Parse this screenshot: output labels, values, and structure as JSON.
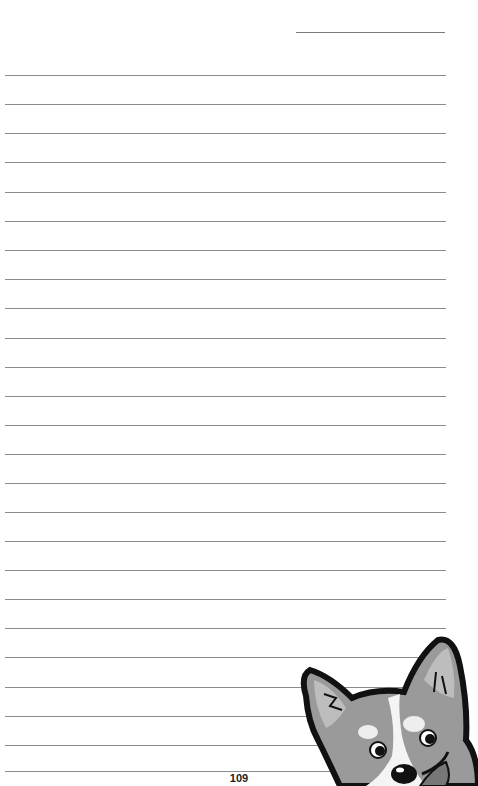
{
  "page": {
    "type": "lined-notebook-page",
    "page_number": "109",
    "line_count": 25,
    "top_line": {
      "label": "date-line"
    },
    "line_positions": [
      75,
      104,
      133,
      162,
      192,
      221,
      250,
      279,
      308,
      338,
      367,
      396,
      425,
      454,
      483,
      512,
      541,
      570,
      599,
      628,
      657,
      687,
      716,
      745,
      771
    ]
  },
  "illustration": {
    "subject": "corgi-dog-peeking",
    "style": "grayscale cartoon"
  },
  "colors": {
    "line": "#8c8c8c",
    "text": "#222222",
    "background": "#ffffff"
  }
}
